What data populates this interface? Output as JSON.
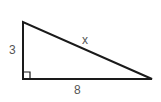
{
  "diagram": {
    "type": "right-triangle",
    "labels": {
      "vertical_leg": "3",
      "horizontal_leg": "8",
      "hypotenuse": "x"
    },
    "colors": {
      "stroke": "#1a1a1a",
      "label": "#555555",
      "background": "#ffffff"
    }
  }
}
